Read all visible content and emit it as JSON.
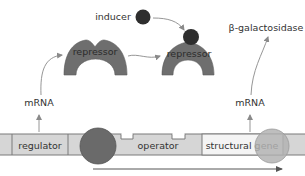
{
  "colors": {
    "dna_fill": "#d6d6d6",
    "dna_stroke": "#7a7a7a",
    "gene_fill": "#f4f4f4",
    "repressor": "#6e6e6e",
    "polymerase": "#6a6a6a",
    "inducer": "#2e2e2e",
    "product_circle": "#b3b3b3",
    "arrow": "#8a8a8a"
  },
  "labels": {
    "inducer": "inducer",
    "repressor_free": "repressor",
    "repressor_bound": "repressor",
    "product": "β-galactosidase",
    "mrna_regulator": "mRNA",
    "mrna_structural": "mRNA"
  },
  "dna_segments": [
    {
      "name": "regulator",
      "label": "regulator"
    },
    {
      "name": "operator",
      "label": "operator"
    },
    {
      "name": "structural-gene",
      "label": "structural gene"
    }
  ]
}
